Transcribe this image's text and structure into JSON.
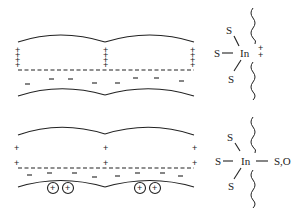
{
  "diagram": {
    "top_panel": {
      "description": "Layered structure with positive charges at sheet edges and negative charges below dashed line",
      "plus_sign": "+",
      "minus_sign": "−",
      "structure": {
        "center_atom": "In",
        "ligand_top": "S",
        "ligand_left": "S",
        "ligand_bottom": "S",
        "charge_label_1": "+",
        "charge_label_2": "+"
      }
    },
    "bottom_panel": {
      "description": "Layered structure with positive charges, dashed line, negative charges and circled cations in interlayer",
      "plus_sign": "+",
      "minus_sign": "−",
      "circled_cation": "+",
      "structure": {
        "center_atom": "In",
        "ligand_top": "S",
        "ligand_left": "S",
        "ligand_bottom": "S",
        "ligand_right": "S,O"
      }
    }
  }
}
